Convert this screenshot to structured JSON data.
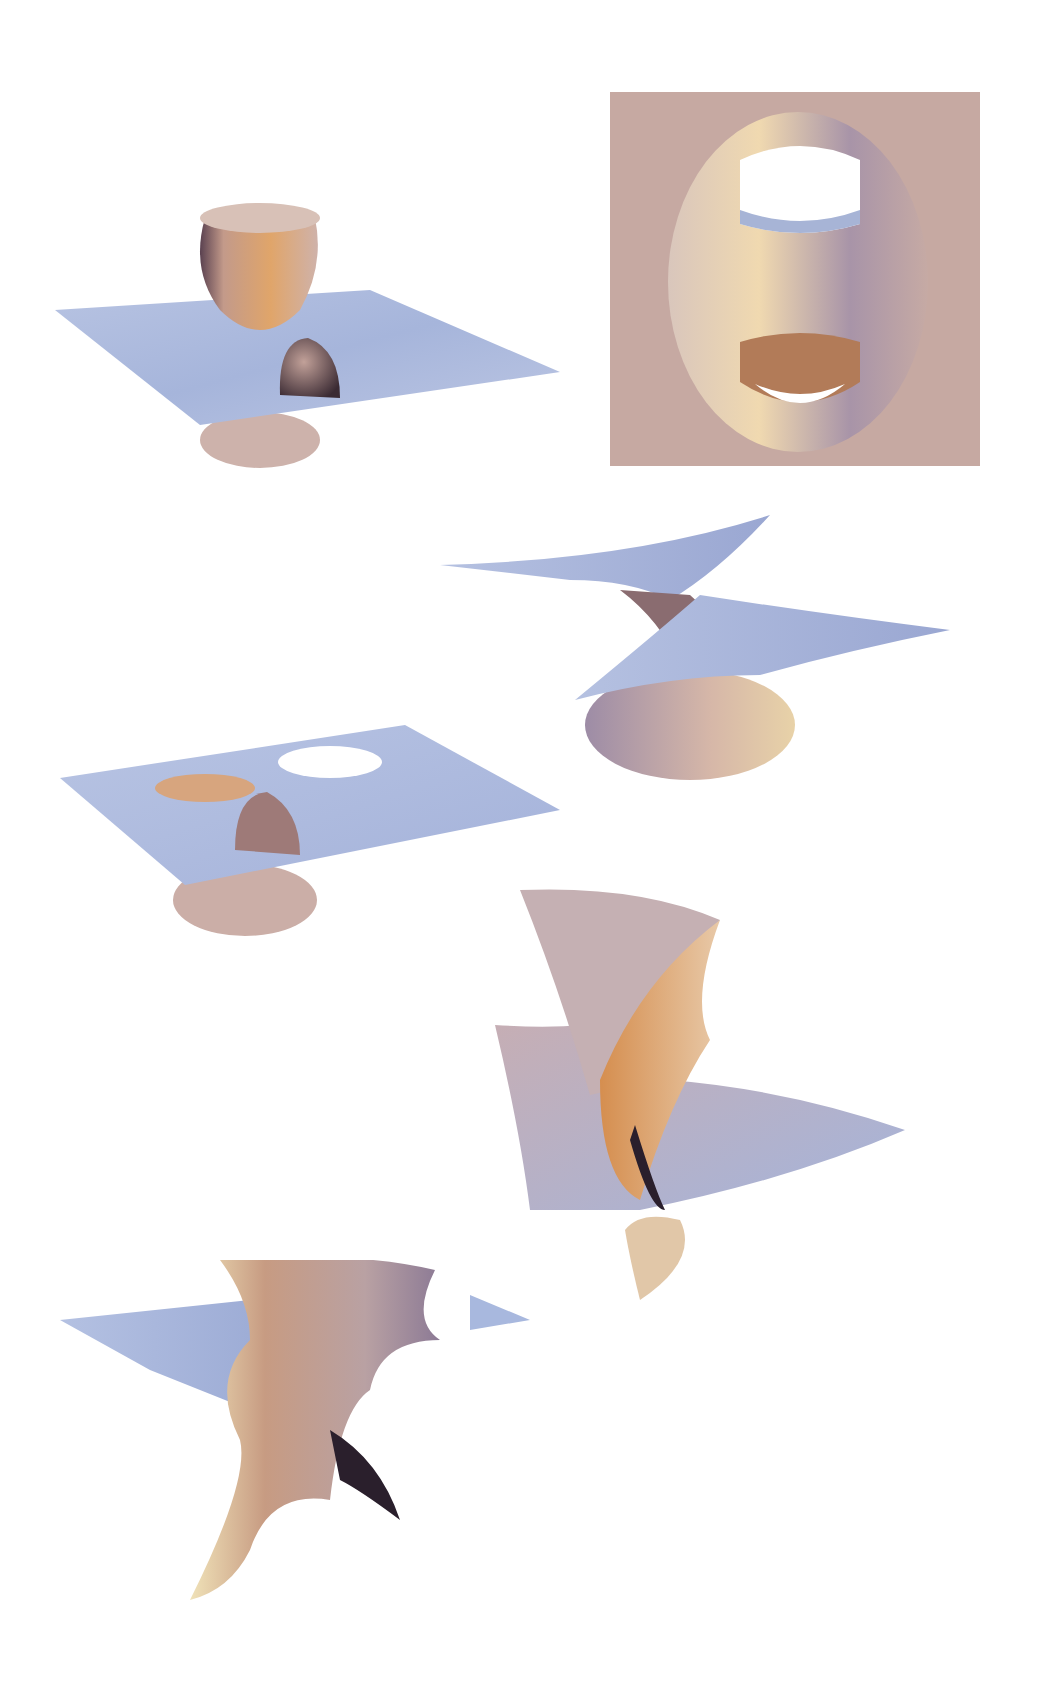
{
  "page": {
    "background": "#ffffff"
  },
  "palette": {
    "plane_blue": "#a9b8dc",
    "plane_blue_dark": "#8c9acb",
    "surface_tan": "#c9ada6",
    "surface_orange": "#d79a63",
    "highlight_yellow": "#f4e6b0",
    "shadow_dark": "#2a1f2c",
    "square_bg": "#c6a9a2"
  },
  "figures": [
    {
      "id": "fig-1",
      "description": "catenoid-like neck through plane with small lobe",
      "position": "top-left"
    },
    {
      "id": "fig-2",
      "description": "top view of surface in square frame with two openings",
      "position": "top-right"
    },
    {
      "id": "fig-3",
      "description": "twisted saddle sheets over cone",
      "position": "upper-right"
    },
    {
      "id": "fig-4",
      "description": "plane with two holes and lobe above cone",
      "position": "middle-left"
    },
    {
      "id": "fig-5",
      "description": "tall folded surface with plane and lower lobe",
      "position": "lower-right"
    },
    {
      "id": "fig-6",
      "description": "barrel-like surface with flaring ends",
      "position": "bottom-left"
    }
  ]
}
